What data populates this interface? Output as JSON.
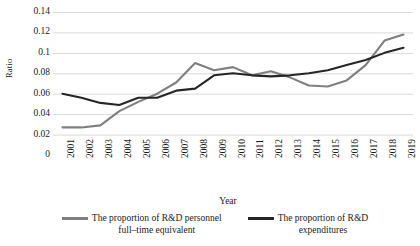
{
  "chart_data": {
    "type": "line",
    "title": "",
    "xlabel": "Year",
    "ylabel": "Ratio",
    "grid": true,
    "legend_position": "bottom",
    "ylim": [
      0,
      0.14
    ],
    "yticks": [
      "0.14",
      "0.12",
      "0.1",
      "0.08",
      "0.06",
      "0.04",
      "0.02",
      "0"
    ],
    "ytick_values": [
      0.14,
      0.12,
      0.1,
      0.08,
      0.06,
      0.04,
      0.02,
      0
    ],
    "categories": [
      "2001",
      "2002",
      "2003",
      "2004",
      "2005",
      "2006",
      "2007",
      "2008",
      "2009",
      "2010",
      "2011",
      "2012",
      "2013",
      "2014",
      "2015",
      "2016",
      "2017",
      "2018",
      "2019"
    ],
    "series": [
      {
        "name": "The proportion of R&D personnel full-time equivalent",
        "color": "#7f7f7f",
        "values": [
          0.027,
          0.027,
          0.029,
          0.043,
          0.052,
          0.06,
          0.071,
          0.09,
          0.083,
          0.086,
          0.078,
          0.082,
          0.076,
          0.068,
          0.067,
          0.073,
          0.088,
          0.112,
          0.118
        ]
      },
      {
        "name": "The proportion of R&D expenditures",
        "color": "#262626",
        "values": [
          0.06,
          0.056,
          0.051,
          0.049,
          0.056,
          0.056,
          0.063,
          0.065,
          0.078,
          0.08,
          0.078,
          0.077,
          0.078,
          0.08,
          0.083,
          0.088,
          0.093,
          0.1,
          0.105
        ]
      }
    ]
  },
  "legend": {
    "items": [
      {
        "label_line1": "The proportion of R&D personnel",
        "label_line2": "full–time equivalent",
        "color": "#7f7f7f"
      },
      {
        "label_line1": "The proportion of R&D",
        "label_line2": "expenditures",
        "color": "#262626"
      }
    ]
  },
  "colors": {
    "gridline": "#d9d9d9",
    "axis": "#bfbfbf",
    "text": "#1a1a1a",
    "background": "#ffffff"
  }
}
